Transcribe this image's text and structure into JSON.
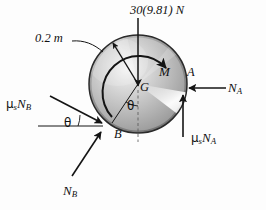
{
  "figure": {
    "type": "free-body-diagram",
    "background_color": "#fdfdfd",
    "ink_color": "#111111",
    "labels": {
      "weight": "30(9.81) N",
      "radius": "0.2 m",
      "moment": "M",
      "center_of_gravity": "G",
      "point_a": "A",
      "point_b": "B",
      "normal_a": "N",
      "normal_a_sub": "A",
      "normal_b": "N",
      "normal_b_sub": "B",
      "friction_a_mu": "μ",
      "friction_a_mu_sub": "s",
      "friction_a_n": "N",
      "friction_a_n_sub": "A",
      "friction_b_mu": "μ",
      "friction_b_mu_sub": "s",
      "friction_b_n": "N",
      "friction_b_n_sub": "B",
      "angle_center": "θ",
      "angle_at_b": "θ"
    },
    "geometry": {
      "disk_center_x": 138,
      "disk_center_y": 84,
      "disk_radius": 49,
      "point_a_x": 185,
      "point_a_y": 98,
      "point_b_x": 104,
      "point_b_y": 124
    },
    "colors": {
      "disk_light": "#f2f2f2",
      "disk_mid": "#b8b8b8",
      "disk_dark": "#8a8a8a",
      "disk_edge": "#6e6e6e",
      "highlight": "#fbfbfb",
      "stroke": "#141414"
    }
  }
}
